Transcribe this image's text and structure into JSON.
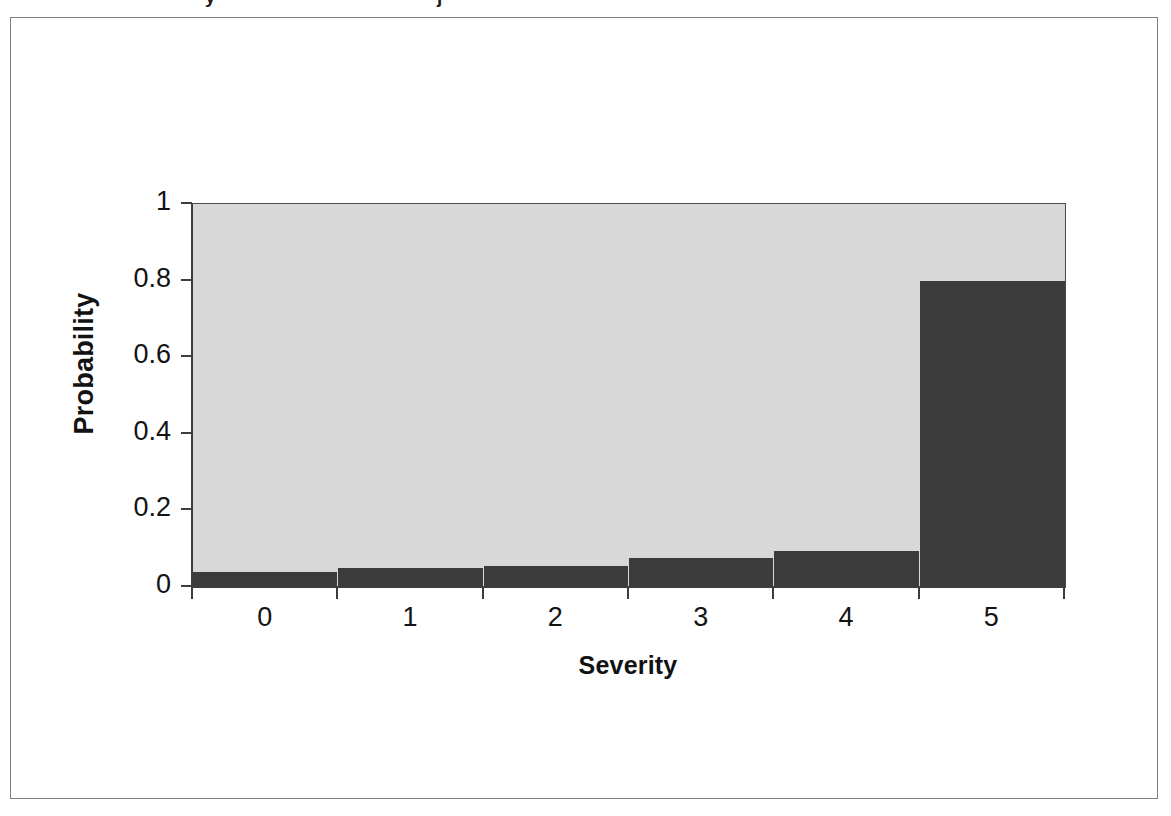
{
  "figure": {
    "caption_remnant_glyphs": [
      "y",
      "j"
    ],
    "frame_color": "#808080",
    "background_color": "#ffffff"
  },
  "chart_data": {
    "type": "bar",
    "title": "",
    "subtitle": "",
    "xlabel": "Severity",
    "ylabel": "Probability",
    "categories": [
      "0",
      "1",
      "2",
      "3",
      "4",
      "5"
    ],
    "values": [
      0.04,
      0.05,
      0.055,
      0.075,
      0.095,
      0.8
    ],
    "xlim": [
      -0.5,
      5.5
    ],
    "ylim": [
      0,
      1
    ],
    "ytick_labels": [
      "0",
      "0.2",
      "0.4",
      "0.6",
      "0.8",
      "1"
    ],
    "ytick_values": [
      0,
      0.2,
      0.4,
      0.6,
      0.8,
      1
    ],
    "xtick_labels": [
      "0",
      "1",
      "2",
      "3",
      "4",
      "5"
    ],
    "grid": false,
    "legend": false,
    "legend_position": "none",
    "bar_color": "#3b3b3b",
    "plot_background_color": "#d8d8d8",
    "axis_color": "#3d3d3d",
    "bar_gap": 0
  }
}
